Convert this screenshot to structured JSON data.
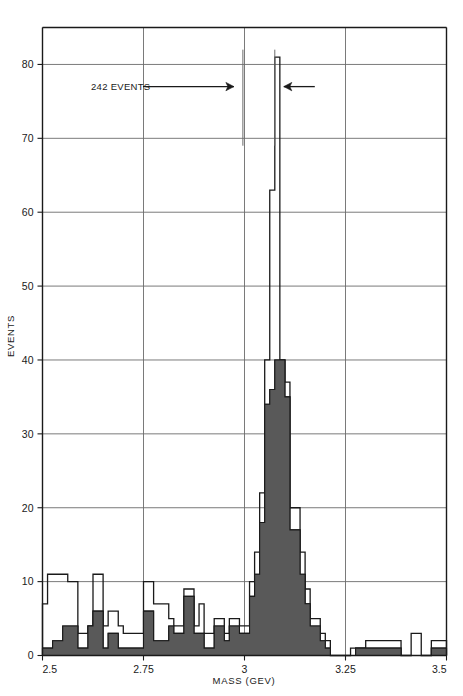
{
  "chart_data": {
    "type": "bar",
    "title": "",
    "subtitle": "",
    "xlabel": "MASS  (GEV)",
    "ylabel": "EVENTS",
    "xlim": [
      2.5,
      3.5
    ],
    "ylim": [
      0,
      85
    ],
    "grid": true,
    "legend_position": "none",
    "x_ticks": [
      "2.5",
      "2.75",
      "3",
      "3.25",
      "3.5"
    ],
    "x_tick_values": [
      2.5,
      2.75,
      3.0,
      3.25,
      3.5
    ],
    "y_ticks": [
      "0",
      "10",
      "20",
      "30",
      "40",
      "50",
      "60",
      "70",
      "80"
    ],
    "y_tick_values": [
      0,
      10,
      20,
      30,
      40,
      50,
      60,
      70,
      80
    ],
    "bin_width": 0.0125,
    "bin_edges": [
      2.5,
      2.5125,
      2.525,
      2.5375,
      2.55,
      2.5625,
      2.575,
      2.5875,
      2.6,
      2.6125,
      2.625,
      2.6375,
      2.65,
      2.6625,
      2.675,
      2.6875,
      2.7,
      2.7125,
      2.725,
      2.7375,
      2.75,
      2.7625,
      2.775,
      2.7875,
      2.8,
      2.8125,
      2.825,
      2.8375,
      2.85,
      2.8625,
      2.875,
      2.8875,
      2.9,
      2.9125,
      2.925,
      2.9375,
      2.95,
      2.9625,
      2.975,
      2.9875,
      3.0,
      3.0125,
      3.025,
      3.0375,
      3.05,
      3.0625,
      3.075,
      3.0875,
      3.1,
      3.1125,
      3.125,
      3.1375,
      3.15,
      3.1625,
      3.175,
      3.1875,
      3.2,
      3.2125,
      3.225,
      3.2375,
      3.25,
      3.2625,
      3.275,
      3.2875,
      3.3,
      3.3125,
      3.325,
      3.3375,
      3.35,
      3.3625,
      3.375,
      3.3875,
      3.4,
      3.4125,
      3.425,
      3.4375,
      3.45,
      3.4625,
      3.475,
      3.4875,
      3.5
    ],
    "series": [
      {
        "name": "total",
        "style": "outline",
        "color": "#1a1a1a",
        "values": [
          7,
          11,
          11,
          11,
          11,
          10,
          10,
          3,
          3,
          4,
          11,
          11,
          4,
          6,
          6,
          4,
          3,
          3,
          3,
          3,
          10,
          10,
          7,
          7,
          7,
          5,
          4,
          4,
          9,
          9,
          4,
          7,
          3,
          3,
          5,
          5,
          3,
          5,
          5,
          4,
          4,
          10,
          14,
          22,
          40,
          63,
          81,
          40,
          37,
          20,
          20,
          14,
          9,
          5,
          5,
          3,
          2,
          0,
          0,
          0,
          0,
          1,
          1,
          1,
          2,
          2,
          2,
          2,
          2,
          2,
          2,
          0,
          0,
          3,
          3,
          0,
          0,
          2,
          2,
          2
        ]
      },
      {
        "name": "subset",
        "style": "filled",
        "color": "#595959",
        "values": [
          1,
          1,
          2,
          2,
          4,
          4,
          4,
          1,
          1,
          4,
          6,
          6,
          1,
          3,
          3,
          1,
          1,
          1,
          1,
          1,
          6,
          6,
          2,
          2,
          2,
          4,
          3,
          3,
          8,
          8,
          3,
          3,
          1,
          1,
          4,
          4,
          2,
          4,
          4,
          3,
          3,
          8,
          11,
          18,
          34,
          36,
          40,
          40,
          35,
          17,
          17,
          11,
          7,
          4,
          4,
          2,
          1,
          0,
          0,
          0,
          0,
          0,
          1,
          1,
          1,
          1,
          1,
          1,
          1,
          1,
          1,
          0,
          0,
          0,
          0,
          0,
          0,
          1,
          1,
          1
        ]
      }
    ],
    "annotations": [
      {
        "id": "events-count",
        "text": "242 EVENTS",
        "arrow": "right",
        "y_value": 77,
        "x_text": 2.62,
        "x_marker": 2.996
      },
      {
        "id": "peak-marker-right",
        "text": "",
        "arrow": "left",
        "y_value": 77,
        "x_marker": 3.075
      }
    ]
  },
  "colors": {
    "background": "#ffffff",
    "axis": "#1a1a1a",
    "grid": "#6b6b6b",
    "outline": "#1a1a1a",
    "fill": "#595959"
  }
}
